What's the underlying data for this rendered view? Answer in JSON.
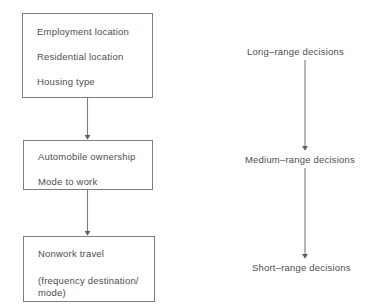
{
  "diagram": {
    "line_color": "#7d7d7d",
    "text_color": "#4d4d4d",
    "background": "#ffffff",
    "left_column": {
      "name": "travel-decision-chain",
      "boxes": [
        {
          "id": "employment",
          "lines": [
            "Employment location",
            "Residential location",
            "Housing type"
          ]
        },
        {
          "id": "automobile",
          "lines": [
            "Automobile ownership",
            "Mode to work"
          ]
        },
        {
          "id": "nonwork",
          "lines": [
            "Nonwork travel",
            "(frequency destination/\nmode)"
          ]
        }
      ],
      "connectors": [
        {
          "id": "employment-to-automobile",
          "from": "employment",
          "to": "automobile",
          "style": "arrow-down"
        },
        {
          "id": "automobile-to-nonwork",
          "from": "automobile",
          "to": "nonwork",
          "style": "arrow-down"
        }
      ]
    },
    "right_column": {
      "name": "decision-horizon-scale",
      "labels": [
        {
          "id": "long-range",
          "text": "Long–range decisions"
        },
        {
          "id": "medium-range",
          "text": "Medium–range decisions"
        },
        {
          "id": "short-range",
          "text": "Short–range decisions"
        }
      ],
      "connectors": [
        {
          "id": "long-to-medium",
          "from": "long-range",
          "to": "medium-range",
          "style": "arrow-down"
        },
        {
          "id": "medium-to-short",
          "from": "medium-range",
          "to": "short-range",
          "style": "arrow-down"
        }
      ]
    }
  }
}
